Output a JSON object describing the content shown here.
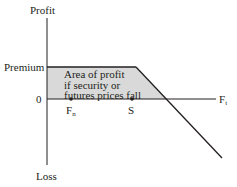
{
  "diagram": {
    "y_axis_top_label": "Profit",
    "y_axis_bottom_label": "Loss",
    "premium_label": "Premium",
    "zero_label": "0",
    "x_axis_label": "F",
    "x_axis_subscript": "t",
    "area_label_lines": [
      "Area of profit",
      "if security or",
      "futures prices fall"
    ],
    "points": [
      {
        "label": "F",
        "subscript": "n",
        "role": "breakeven"
      },
      {
        "label": "S",
        "subscript": "",
        "role": "strike"
      }
    ],
    "colors": {
      "line": "#231f20",
      "shade": "#d9d9d9",
      "axis": "#231f20"
    }
  }
}
